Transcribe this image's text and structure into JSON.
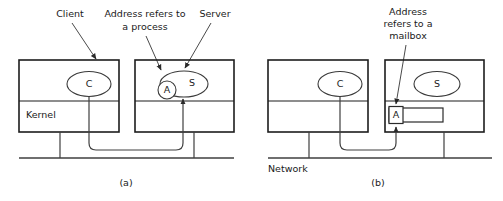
{
  "figure": {
    "panels": [
      {
        "id": "a",
        "caption": "(a)",
        "annotations": [
          {
            "name": "client-annotation",
            "lines": [
              "Client"
            ]
          },
          {
            "name": "address-process-annotation",
            "lines": [
              "Address refers to",
              "a process"
            ]
          },
          {
            "name": "server-annotation",
            "lines": [
              "Server"
            ]
          }
        ],
        "machines": [
          {
            "name": "client-machine",
            "process_label": "C",
            "kernel_label": "Kernel"
          },
          {
            "name": "server-machine",
            "process_label": "S",
            "address_label": "A",
            "kernel_label": ""
          }
        ],
        "bus_label": ""
      },
      {
        "id": "b",
        "caption": "(b)",
        "annotations": [
          {
            "name": "address-mailbox-annotation",
            "lines": [
              "Address",
              "refers to a",
              "mailbox"
            ]
          }
        ],
        "machines": [
          {
            "name": "client-machine",
            "process_label": "C",
            "kernel_label": ""
          },
          {
            "name": "server-machine",
            "process_label": "S",
            "address_label": "A",
            "kernel_label": ""
          }
        ],
        "bus_label": "Network"
      }
    ]
  },
  "colors": {
    "ink": "#1d1d1d",
    "wire": "#3f3f3f",
    "background": "#ffffff"
  }
}
